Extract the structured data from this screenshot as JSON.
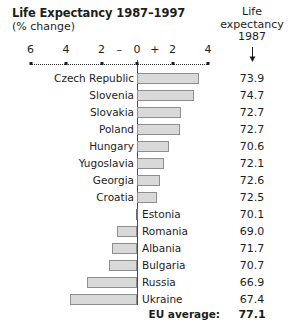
{
  "title": "Life Expectancy 1987–1997",
  "subtitle": "(% change)",
  "right_header": {
    "line1": "Life",
    "line2": "expectancy",
    "line3": "1987",
    "arrow_icon": "down-arrow-icon"
  },
  "eu_average": {
    "label": "EU average:",
    "value": "77.1"
  },
  "chart_data": {
    "type": "bar",
    "orientation": "horizontal",
    "title": "Life Expectancy 1987–1997 (% change)",
    "xlabel": "% change",
    "ylabel": "",
    "xlim": [
      -6,
      4
    ],
    "grid": false,
    "legend": null,
    "axis_ticks": [
      {
        "label": "6",
        "value": -6
      },
      {
        "label": "4",
        "value": -4
      },
      {
        "label": "2",
        "value": -2
      },
      {
        "label": "–",
        "value": -1
      },
      {
        "label": "0",
        "value": 0
      },
      {
        "label": "+",
        "value": 1
      },
      {
        "label": "2",
        "value": 2
      },
      {
        "label": "4",
        "value": 4
      }
    ],
    "tick_marks": [
      -6,
      -4,
      -2,
      0,
      2,
      4
    ],
    "value_column_header": "Life expectancy 1987",
    "categories": [
      "Czech Republic",
      "Slovenia",
      "Slovakia",
      "Poland",
      "Hungary",
      "Yugoslavia",
      "Georgia",
      "Croatia",
      "Estonia",
      "Romania",
      "Albania",
      "Bulgaria",
      "Russia",
      "Ukraine"
    ],
    "series": [
      {
        "name": "% change 1987–1997",
        "values": [
          3.5,
          3.2,
          2.5,
          2.4,
          1.8,
          1.5,
          1.3,
          1.1,
          0.0,
          -1.1,
          -1.4,
          -1.6,
          -2.8,
          -3.8
        ]
      },
      {
        "name": "Life expectancy 1987",
        "values": [
          73.9,
          74.7,
          72.7,
          72.7,
          70.6,
          72.1,
          72.6,
          72.5,
          70.1,
          69.0,
          71.7,
          70.7,
          66.9,
          67.4
        ]
      }
    ],
    "eu_average_life_expectancy": 77.1
  },
  "rows": [
    {
      "country": "Czech Republic",
      "change": 3.5,
      "life": "73.9"
    },
    {
      "country": "Slovenia",
      "change": 3.2,
      "life": "74.7"
    },
    {
      "country": "Slovakia",
      "change": 2.5,
      "life": "72.7"
    },
    {
      "country": "Poland",
      "change": 2.4,
      "life": "72.7"
    },
    {
      "country": "Hungary",
      "change": 1.8,
      "life": "70.6"
    },
    {
      "country": "Yugoslavia",
      "change": 1.5,
      "life": "72.1"
    },
    {
      "country": "Georgia",
      "change": 1.3,
      "life": "72.6"
    },
    {
      "country": "Croatia",
      "change": 1.1,
      "life": "72.5"
    },
    {
      "country": "Estonia",
      "change": 0.0,
      "life": "70.1"
    },
    {
      "country": "Romania",
      "change": -1.1,
      "life": "69.0"
    },
    {
      "country": "Albania",
      "change": -1.4,
      "life": "71.7"
    },
    {
      "country": "Bulgaria",
      "change": -1.6,
      "life": "70.7"
    },
    {
      "country": "Russia",
      "change": -2.8,
      "life": "66.9"
    },
    {
      "country": "Ukraine",
      "change": -3.8,
      "life": "67.4"
    }
  ],
  "colors": {
    "bar_fill": "#d9d9d9",
    "bar_border": "#8e8e8e",
    "axis": "#2b2b2b",
    "text": "#1d1d1d",
    "background": "#ffffff"
  }
}
